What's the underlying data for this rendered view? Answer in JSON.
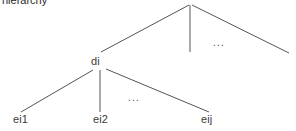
{
  "caption": {
    "title": "hierarchy"
  },
  "diagram": {
    "type": "tree",
    "line_color": "#555555",
    "text_color": "#3a3a3a",
    "background_color": "#ffffff",
    "nodes": [
      {
        "id": "root",
        "label": "",
        "x": 190,
        "y": 4,
        "level": 0
      },
      {
        "id": "di",
        "label": "di",
        "x": 98,
        "y": 62,
        "level": 1
      },
      {
        "id": "sibling-mid",
        "label": "",
        "x": 190,
        "y": 52,
        "level": 1
      },
      {
        "id": "sibling-right",
        "label": "",
        "x": 288,
        "y": 52,
        "level": 1
      },
      {
        "id": "ei1",
        "label": "ei1",
        "x": 22,
        "y": 120,
        "level": 2
      },
      {
        "id": "ei2",
        "label": "ei2",
        "x": 100,
        "y": 120,
        "level": 2
      },
      {
        "id": "eij",
        "label": "eij",
        "x": 209,
        "y": 120,
        "level": 2
      }
    ],
    "edges": [
      {
        "from": "root",
        "to": "di",
        "x1": 189,
        "y1": 5,
        "x2": 101,
        "y2": 52
      },
      {
        "from": "root",
        "to": "sibling-mid",
        "x1": 190,
        "y1": 5,
        "x2": 190,
        "y2": 52
      },
      {
        "from": "root",
        "to": "sibling-right",
        "x1": 192,
        "y1": 5,
        "x2": 289,
        "y2": 53
      },
      {
        "from": "di",
        "to": "ei1",
        "x1": 93,
        "y1": 70,
        "x2": 21,
        "y2": 112
      },
      {
        "from": "di",
        "to": "ei2",
        "x1": 100,
        "y1": 70,
        "x2": 100,
        "y2": 112
      },
      {
        "from": "di",
        "to": "eij",
        "x1": 106,
        "y1": 69,
        "x2": 209,
        "y2": 112
      }
    ],
    "ellipses": [
      {
        "id": "ellipsis-top",
        "label": "...",
        "x": 213,
        "y": 37
      },
      {
        "id": "ellipsis-bottom",
        "label": "...",
        "x": 128,
        "y": 92
      }
    ]
  }
}
